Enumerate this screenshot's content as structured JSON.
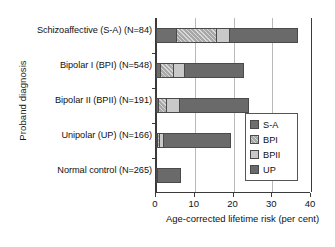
{
  "chart_data": {
    "type": "bar",
    "orientation": "horizontal",
    "stacked": true,
    "title": "",
    "xlabel": "Age-corrected lifetime risk (per cent)",
    "ylabel": "Proband diagnosis",
    "xlim": [
      0,
      40
    ],
    "xticks": [
      0,
      10,
      20,
      30,
      40
    ],
    "xtick_labels": [
      "0",
      "10",
      "20",
      "30",
      "40"
    ],
    "grid": true,
    "legend_position": "center-right",
    "categories": [
      "Schizoaffective (S-A) (N=84)",
      "Bipolar I (BPI) (N=548)",
      "Bipolar II (BPII) (N=191)",
      "Unipolar (UP) (N=166)",
      "Normal control (N=265)"
    ],
    "series": [
      {
        "name": "S-A",
        "color": "#6e6e6e",
        "values": [
          5.5,
          1.3,
          0.8,
          0.5,
          0.4
        ]
      },
      {
        "name": "BPI",
        "color": "#a8a8a8",
        "values": [
          10.5,
          3.6,
          2.3,
          0.8,
          0.0
        ]
      },
      {
        "name": "BPII",
        "color": "#c9c9c9",
        "values": [
          3.5,
          3.1,
          3.6,
          1.2,
          0.0
        ]
      },
      {
        "name": "UP",
        "color": "#6a6a6a",
        "values": [
          18.0,
          15.5,
          18.0,
          17.5,
          6.1
        ]
      }
    ],
    "totals": [
      37.5,
      23.5,
      24.7,
      20.0,
      6.5
    ]
  },
  "legend": {
    "items": [
      {
        "label": "S-A"
      },
      {
        "label": "BPI"
      },
      {
        "label": "BPII"
      },
      {
        "label": "UP"
      }
    ]
  }
}
